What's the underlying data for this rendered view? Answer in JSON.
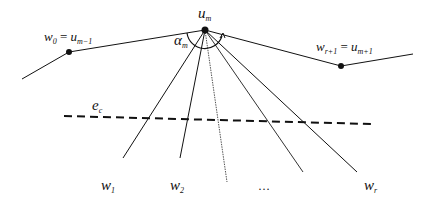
{
  "diagram": {
    "hub": {
      "id": "u_m",
      "label": "u",
      "sub": "m",
      "x": 205,
      "y": 30
    },
    "angle_label": {
      "label": "α",
      "sub": "m"
    },
    "left_neighbor": {
      "label_main": "w",
      "label_main_sub": "0",
      "eq": "=",
      "label_alt": "u",
      "label_alt_sub": "m−1",
      "x": 69,
      "y": 52
    },
    "right_neighbor": {
      "label_main": "w",
      "label_main_sub": "r+1",
      "eq": "=",
      "label_alt": "u",
      "label_alt_sub": "m+1",
      "x": 341,
      "y": 66
    },
    "edge_label": {
      "label": "e",
      "sub": "c"
    },
    "bottom_labels": [
      {
        "label": "w",
        "sub": "1"
      },
      {
        "label": "w",
        "sub": "2"
      },
      {
        "label": "…",
        "sub": ""
      },
      {
        "label": "w",
        "sub": "r"
      }
    ],
    "colors": {
      "stroke": "#111111",
      "dotted": "#555555",
      "background": "#ffffff"
    }
  }
}
